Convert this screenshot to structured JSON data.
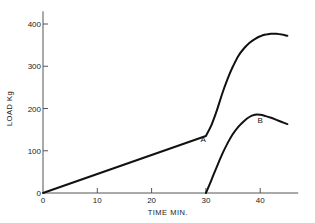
{
  "chart_data": {
    "type": "line",
    "title": "",
    "xlabel": "TIME  MIN.",
    "ylabel": "LOAD  Kg",
    "xlim": [
      0,
      47
    ],
    "ylim": [
      0,
      430
    ],
    "x_ticks": [
      0,
      10,
      20,
      30,
      40
    ],
    "x_tick_labels": [
      "0",
      "10",
      "20",
      "30",
      "40"
    ],
    "y_ticks": [
      0,
      100,
      200,
      300,
      400
    ],
    "y_tick_labels": [
      "0",
      "100",
      "200",
      "300",
      "400"
    ],
    "grid": false,
    "legend": "none",
    "series": [
      {
        "name": "A",
        "label": "A",
        "label_at": [
          29.5,
          120
        ],
        "x": [
          0,
          10,
          20,
          30,
          31,
          32,
          33,
          34,
          35,
          36,
          37,
          38,
          39,
          40,
          41,
          42,
          43,
          44,
          45
        ],
        "y": [
          0,
          45,
          90,
          135,
          160,
          195,
          235,
          270,
          300,
          325,
          342,
          355,
          364,
          371,
          375,
          377,
          377,
          375,
          372
        ]
      },
      {
        "name": "B",
        "label": "B",
        "label_at": [
          40,
          165
        ],
        "x": [
          30,
          31,
          32,
          33,
          34,
          35,
          36,
          37,
          38,
          39,
          40,
          41,
          42,
          43,
          44,
          45
        ],
        "y": [
          0,
          30,
          62,
          92,
          118,
          140,
          157,
          170,
          180,
          185,
          185,
          182,
          178,
          173,
          168,
          163
        ]
      }
    ]
  }
}
